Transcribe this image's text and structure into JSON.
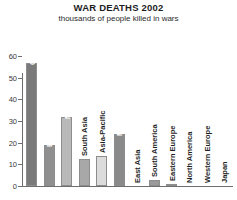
{
  "header": {
    "title": "WAR DEATHS 2002",
    "subtitle": "thousands of people killed in wars"
  },
  "chart_data": {
    "type": "bar",
    "title": "WAR DEATHS 2002",
    "subtitle": "thousands of people killed in wars",
    "xlabel": "",
    "ylabel": "",
    "ylim": [
      0,
      60
    ],
    "yticks": [
      0,
      10,
      20,
      30,
      40,
      50,
      60
    ],
    "ytick_labels": [
      "0",
      "10",
      "20",
      "30",
      "40",
      "50",
      "60"
    ],
    "grid": false,
    "legend": false,
    "categories": [
      "Central Africa",
      "E. and S. Africa",
      "Northern Africa",
      "South Asia",
      "Asia-Pacific",
      "Middle East",
      "East Asia",
      "South America",
      "Eastern Europe",
      "North America",
      "Western Europe",
      "Japan"
    ],
    "values": [
      57,
      19,
      32,
      12.5,
      14,
      24,
      0,
      3,
      0.7,
      0,
      0,
      0
    ],
    "bar_colors": [
      "#7a7a7a",
      "#8f8f8f",
      "#b9b9b9",
      "#a8a8a8",
      "#dcdcdc",
      "#8a8a8a",
      "#9a9a9a",
      "#9a9a9a",
      "#6f6f6f",
      "#9a9a9a",
      "#9a9a9a",
      "#9a9a9a"
    ],
    "label_inside": [
      true,
      true,
      true,
      false,
      false,
      true,
      false,
      false,
      false,
      false,
      false,
      false
    ]
  },
  "colors": {
    "axis": "#6e6e6e",
    "text": "#1f1f1f",
    "background": "#ffffff"
  }
}
